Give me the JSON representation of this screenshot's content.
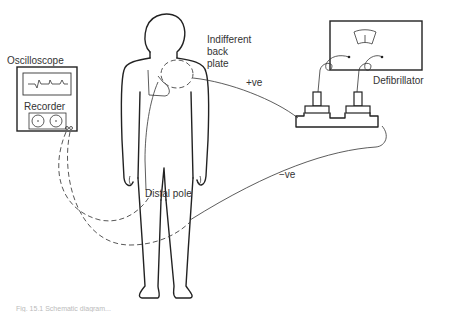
{
  "diagram": {
    "labels": {
      "oscilloscope": "Oscilloscope",
      "recorder": "Recorder",
      "indifferent_line1": "Indifferent",
      "indifferent_line2": "back",
      "indifferent_line3": "plate",
      "positive": "+ve",
      "negative": "−ve",
      "defibrillator": "Defibrillator",
      "distal_pole": "Distal pole"
    },
    "caption": "Fig. 15.1 Schematic diagram..."
  }
}
